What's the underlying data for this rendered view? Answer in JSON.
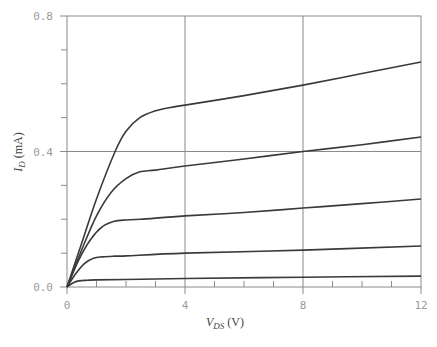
{
  "chart_data": {
    "type": "line",
    "title": "",
    "xlabel": "V_DS (V)",
    "ylabel": "I_D (mA)",
    "xlim": [
      0,
      12
    ],
    "ylim": [
      0,
      0.8
    ],
    "x_ticks": [
      0,
      4,
      8,
      12
    ],
    "x_tick_labels": [
      "0",
      "4",
      "8",
      "12"
    ],
    "x_minor_ticks": [
      1,
      2,
      3,
      5,
      6,
      7,
      9,
      10,
      11
    ],
    "y_ticks": [
      0.0,
      0.4,
      0.8
    ],
    "y_tick_labels": [
      "0.0",
      "0.4",
      "0.8"
    ],
    "y_minor_ticks": [
      0.1,
      0.2,
      0.3,
      0.5,
      0.6,
      0.7
    ],
    "grid": {
      "x": [
        4,
        8
      ],
      "y": [
        0.4
      ]
    },
    "legend": null,
    "series": [
      {
        "name": "curve-1",
        "x": [
          0,
          0.5,
          1.0,
          1.63,
          2.0,
          2.47,
          3.0,
          3.5,
          4,
          6,
          8,
          10,
          12
        ],
        "y": [
          0,
          0.13,
          0.26,
          0.4,
          0.46,
          0.5,
          0.52,
          0.53,
          0.537,
          0.565,
          0.596,
          0.63,
          0.664
        ]
      },
      {
        "name": "curve-2",
        "x": [
          0,
          0.5,
          1.0,
          1.5,
          2.0,
          2.47,
          3.0,
          4,
          6,
          8,
          10,
          12
        ],
        "y": [
          0,
          0.11,
          0.21,
          0.28,
          0.32,
          0.34,
          0.345,
          0.357,
          0.378,
          0.4,
          0.42,
          0.443
        ]
      },
      {
        "name": "curve-3",
        "x": [
          0,
          0.4,
          0.8,
          1.2,
          1.6,
          2.0,
          2.5,
          4,
          6,
          8,
          10,
          12
        ],
        "y": [
          0,
          0.08,
          0.14,
          0.178,
          0.194,
          0.198,
          0.2,
          0.21,
          0.22,
          0.233,
          0.246,
          0.26
        ]
      },
      {
        "name": "curve-4",
        "x": [
          0,
          0.3,
          0.6,
          0.9,
          1.2,
          1.6,
          2,
          4,
          8,
          12
        ],
        "y": [
          0,
          0.04,
          0.07,
          0.085,
          0.089,
          0.091,
          0.092,
          0.1,
          0.109,
          0.121
        ]
      },
      {
        "name": "curve-5",
        "x": [
          0,
          0.2,
          0.4,
          0.7,
          1.0,
          2,
          4,
          8,
          12
        ],
        "y": [
          0,
          0.012,
          0.018,
          0.02,
          0.021,
          0.022,
          0.025,
          0.029,
          0.032
        ]
      }
    ]
  },
  "axes": {
    "x_title_main": "V",
    "x_title_sub": "DS",
    "x_title_unit": " (V)",
    "y_title_main": "I",
    "y_title_sub": "D",
    "y_title_unit": " (mA)"
  },
  "style": {
    "curve_color": "#3a3a3a",
    "axis_color": "#8a8a8a",
    "tick_label_color": "#9a9a9a"
  }
}
